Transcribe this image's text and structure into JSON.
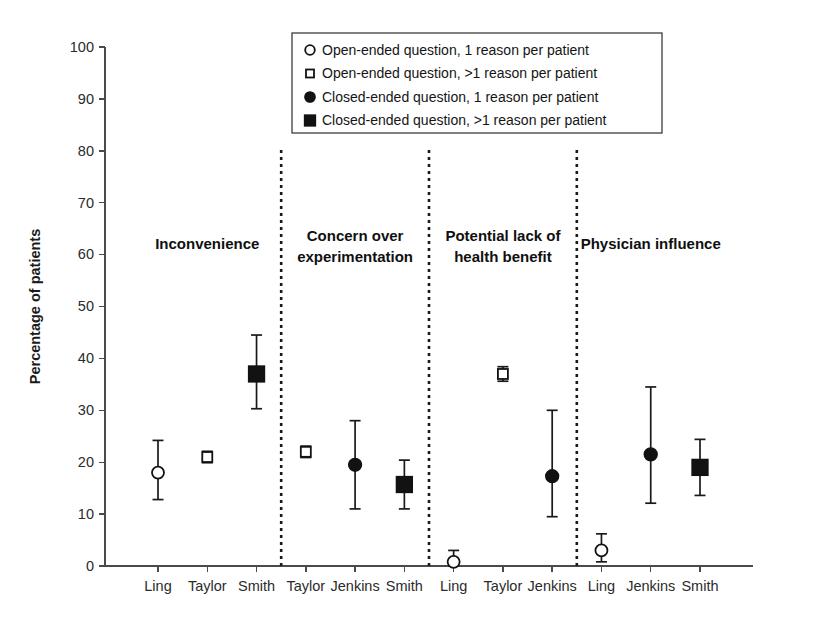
{
  "chart_data": {
    "type": "scatter",
    "title": "",
    "xlabel": "",
    "ylabel": "Percentage of patients",
    "ylim": [
      0,
      100
    ],
    "ytick_values": [
      0,
      10,
      20,
      30,
      40,
      50,
      60,
      70,
      80,
      90,
      100
    ],
    "ytick_labels": [
      "0",
      "10",
      "20",
      "30",
      "40",
      "50",
      "60",
      "70",
      "80",
      "90",
      "100"
    ],
    "grid": false,
    "legend_position": "top-center",
    "legend": [
      {
        "marker": "open-circle",
        "label": "Open-ended question, 1 reason per patient"
      },
      {
        "marker": "open-square",
        "label": "Open-ended question, >1 reason per patient"
      },
      {
        "marker": "filled-circle",
        "label": "Closed-ended question, 1 reason per patient"
      },
      {
        "marker": "filled-square",
        "label": "Closed-ended question, >1 reason per patient"
      }
    ],
    "panels": [
      {
        "name": "Inconvenience",
        "title_lines": [
          "Inconvenience"
        ],
        "points": [
          {
            "x": "Ling",
            "marker": "open-circle",
            "value": 18.0,
            "low": 12.8,
            "high": 24.2
          },
          {
            "x": "Taylor",
            "marker": "open-square",
            "value": 21.0,
            "low": 19.9,
            "high": 22.1
          },
          {
            "x": "Smith",
            "marker": "filled-square",
            "value": 37.0,
            "low": 30.3,
            "high": 44.5
          }
        ]
      },
      {
        "name": "Concern over experimentation",
        "title_lines": [
          "Concern over",
          "experimentation"
        ],
        "points": [
          {
            "x": "Taylor",
            "marker": "open-square",
            "value": 22.0,
            "low": 20.9,
            "high": 23.1
          },
          {
            "x": "Jenkins",
            "marker": "filled-circle",
            "value": 19.5,
            "low": 11.0,
            "high": 28.0
          },
          {
            "x": "Smith",
            "marker": "filled-square",
            "value": 15.7,
            "low": 11.0,
            "high": 20.4
          }
        ]
      },
      {
        "name": "Potential lack of health benefit",
        "title_lines": [
          "Potential lack of",
          "health benefit"
        ],
        "points": [
          {
            "x": "Ling",
            "marker": "open-circle",
            "value": 0.8,
            "low": 0.0,
            "high": 3.0
          },
          {
            "x": "Taylor",
            "marker": "open-square",
            "value": 37.0,
            "low": 35.6,
            "high": 38.4
          },
          {
            "x": "Jenkins",
            "marker": "filled-circle",
            "value": 17.3,
            "low": 9.5,
            "high": 30.0
          }
        ]
      },
      {
        "name": "Physician influence",
        "title_lines": [
          "Physician influence"
        ],
        "points": [
          {
            "x": "Ling",
            "marker": "open-circle",
            "value": 3.0,
            "low": 0.8,
            "high": 6.2
          },
          {
            "x": "Jenkins",
            "marker": "filled-circle",
            "value": 21.5,
            "low": 12.1,
            "high": 34.5
          },
          {
            "x": "Smith",
            "marker": "filled-square",
            "value": 19.0,
            "low": 13.6,
            "high": 24.4
          }
        ]
      }
    ],
    "xtick_labels": [
      "Ling",
      "Taylor",
      "Smith",
      "Taylor",
      "Jenkins",
      "Smith",
      "Ling",
      "Taylor",
      "Jenkins",
      "Ling",
      "Jenkins",
      "Smith"
    ],
    "colors": {
      "marker": "#121212",
      "axis": "#4a4a4a",
      "separator": "#1a1a1a",
      "background": "#ffffff"
    }
  }
}
